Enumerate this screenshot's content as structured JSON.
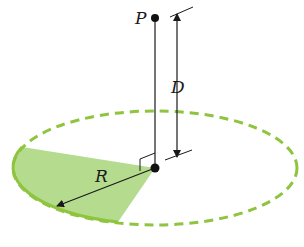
{
  "diagram": {
    "labels": {
      "point": "P",
      "distance": "D",
      "radius": "R"
    },
    "colors": {
      "ring": "#8fc43f",
      "sector_fill": "#a8d67a",
      "line": "#1a1a1a"
    },
    "elements": [
      {
        "name": "point-P",
        "type": "dot"
      },
      {
        "name": "center-point",
        "type": "dot"
      },
      {
        "name": "axis-line",
        "type": "line"
      },
      {
        "name": "distance-arrow-D",
        "type": "double-arrow"
      },
      {
        "name": "radius-arrow-R",
        "type": "arrow"
      },
      {
        "name": "ring-ellipse",
        "type": "dashed-ellipse"
      },
      {
        "name": "shaded-sector",
        "type": "sector"
      },
      {
        "name": "right-angle-marker",
        "type": "marker"
      }
    ]
  }
}
